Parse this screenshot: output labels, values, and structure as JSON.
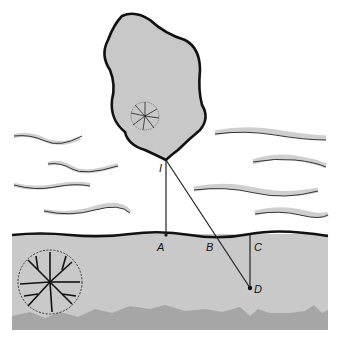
{
  "labels": {
    "I": "I",
    "A": "A",
    "B": "B",
    "C": "C",
    "D": "D"
  },
  "colors": {
    "background": "#ffffff",
    "blob_fill": "#c8c8c8",
    "ground_fill": "#c9c9c9",
    "bedrock_fill": "#a6a6a6",
    "wave_shadow": "#cfcfcf",
    "stroke": "#111111"
  }
}
